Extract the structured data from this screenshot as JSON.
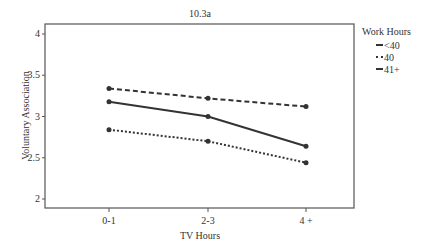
{
  "chart_data": {
    "type": "line",
    "title": "10.3a",
    "xlabel": "TV Hours",
    "ylabel": "Voluntary Association",
    "categories": [
      "0-1",
      "2-3",
      "4 +"
    ],
    "ylim": [
      2,
      4
    ],
    "yticks": [
      "2",
      "2.5",
      "3",
      "3.5",
      "4"
    ],
    "grid": false,
    "legend_title": "Work Hours",
    "legend_position": "right",
    "series": [
      {
        "name": "<40",
        "style": "solid",
        "values": [
          3.18,
          3.0,
          2.64
        ]
      },
      {
        "name": "40",
        "style": "dotted",
        "values": [
          2.84,
          2.7,
          2.44
        ]
      },
      {
        "name": "41+",
        "style": "dashed",
        "values": [
          3.34,
          3.22,
          3.12
        ]
      }
    ]
  },
  "colors": {
    "line": "#333333",
    "axis": "#555555"
  }
}
